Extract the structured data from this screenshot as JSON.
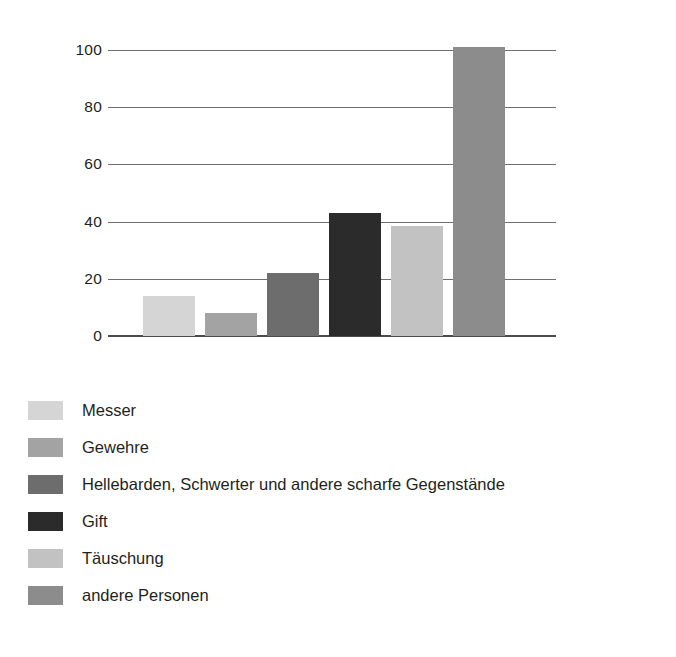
{
  "chart_data": {
    "type": "bar",
    "title": "",
    "subtitle": "",
    "xlabel": "",
    "ylabel": "",
    "categories": [
      "Messer",
      "Gewehre",
      "Hellebarden, Schwerter und andere scharfe Gegenstände",
      "Gift",
      "Täuschung",
      "andere Personen"
    ],
    "values": [
      14,
      8,
      22,
      43,
      38.5,
      101
    ],
    "ylim": [
      0,
      100
    ],
    "yticks": [
      0,
      20,
      40,
      60,
      80,
      100
    ],
    "ytick_labels": [
      "0",
      "20",
      "40",
      "60",
      "80",
      "100"
    ],
    "xtick_labels": [
      "",
      "",
      "",
      "",
      "",
      ""
    ],
    "grid": "horizontal",
    "legend_position": "below",
    "colors": [
      "#d5d5d5",
      "#a3a3a3",
      "#6d6d6d",
      "#2b2b2b",
      "#c2c2c2",
      "#8c8c8c"
    ],
    "axis_color": "#6e6e6e",
    "baseline_color": "#4a4a4a",
    "background": "#ffffff"
  },
  "legend": {
    "items": [
      {
        "label": "Messer",
        "color": "#d5d5d5"
      },
      {
        "label": "Gewehre",
        "color": "#a3a3a3"
      },
      {
        "label": "Hellebarden, Schwerter und andere scharfe Gegenstände",
        "color": "#6d6d6d"
      },
      {
        "label": "Gift",
        "color": "#2b2b2b"
      },
      {
        "label": "Täuschung",
        "color": "#c2c2c2"
      },
      {
        "label": "andere Personen",
        "color": "#8c8c8c"
      }
    ]
  }
}
